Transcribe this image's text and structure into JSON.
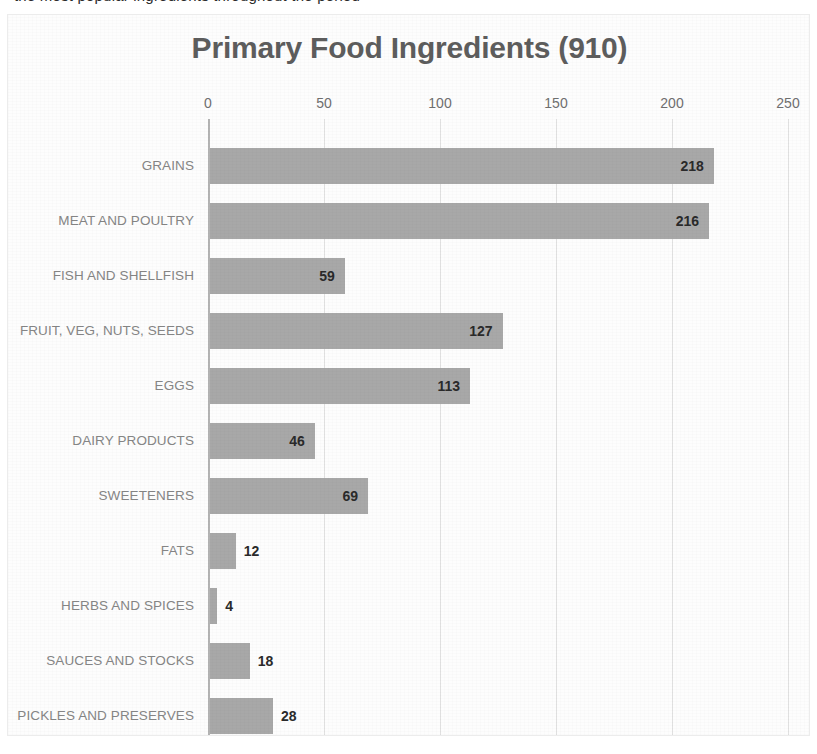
{
  "page": {
    "clipped_header_fragment": "the most popular ingredients throughout the period"
  },
  "chart_data": {
    "type": "bar",
    "orientation": "horizontal",
    "title": "Primary Food Ingredients (910)",
    "xlabel": "",
    "ylabel": "",
    "xlim": [
      0,
      250
    ],
    "xticks": [
      0,
      50,
      100,
      150,
      200,
      250
    ],
    "xtick_labels": [
      "0",
      "50",
      "100",
      "150",
      "200",
      "250"
    ],
    "grid": true,
    "grid_axis": "x",
    "legend": false,
    "bar_color": "#a8a8a8",
    "title_color": "#5d5d5d",
    "category_label_color": "#858585",
    "tick_label_color": "#6f6f6f",
    "data_label_color": "#2a2a2a",
    "gridline_color": "#e3e3e3",
    "axis_color": "#b4b4b4",
    "total": 910,
    "categories": [
      "GRAINS",
      "MEAT AND POULTRY",
      "FISH AND SHELLFISH",
      "FRUIT, VEG, NUTS, SEEDS",
      "EGGS",
      "DAIRY PRODUCTS",
      "SWEETENERS",
      "FATS",
      "HERBS AND SPICES",
      "SAUCES AND STOCKS",
      "PICKLES AND PRESERVES"
    ],
    "values": [
      218,
      216,
      59,
      127,
      113,
      46,
      69,
      12,
      4,
      18,
      28
    ],
    "value_labels": [
      "218",
      "216",
      "59",
      "127",
      "113",
      "46",
      "69",
      "12",
      "4",
      "18",
      "28"
    ],
    "label_placement": [
      "inside",
      "inside",
      "inside",
      "inside",
      "inside",
      "inside",
      "inside",
      "outside",
      "outside",
      "outside",
      "outside"
    ]
  }
}
